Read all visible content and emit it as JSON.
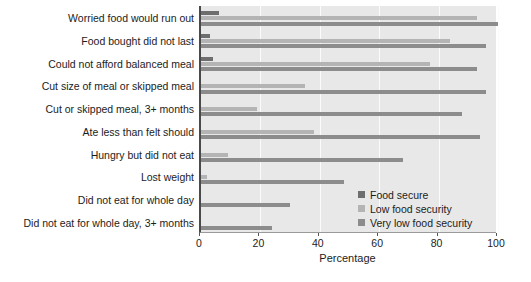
{
  "chart_data": {
    "type": "bar",
    "orientation": "horizontal",
    "title": "",
    "xlabel": "Percentage",
    "ylabel": "",
    "xlim": [
      0,
      100
    ],
    "xticks": [
      0,
      20,
      40,
      60,
      80,
      100
    ],
    "grid": "vertical",
    "legend_position": "inside-bottom-right",
    "categories": [
      "Worried food would run out",
      "Food bought did not last",
      "Could not afford balanced meal",
      "Cut size of meal or skipped meal",
      "Cut or skipped meal, 3+ months",
      "Ate less than felt should",
      "Hungry but did not eat",
      "Lost weight",
      "Did not eat for whole day",
      "Did not eat for whole day, 3+ months"
    ],
    "series": [
      {
        "name": "Food secure",
        "color": "#6e6e6e",
        "values": [
          6,
          3,
          4,
          0,
          0,
          0,
          0,
          0,
          0,
          0
        ]
      },
      {
        "name": "Low food security",
        "color": "#b4b4b4",
        "values": [
          93,
          84,
          77,
          35,
          19,
          38,
          9,
          2,
          0,
          0
        ]
      },
      {
        "name": "Very low food security",
        "color": "#8c8c8c",
        "values": [
          100,
          96,
          93,
          96,
          88,
          94,
          68,
          48,
          30,
          24
        ]
      }
    ]
  },
  "legend": {
    "items": [
      {
        "label": "Food secure",
        "swatch": "s0"
      },
      {
        "label": "Low food security",
        "swatch": "s1"
      },
      {
        "label": "Very low food security",
        "swatch": "s2"
      }
    ]
  },
  "axis": {
    "x_title": "Percentage"
  }
}
